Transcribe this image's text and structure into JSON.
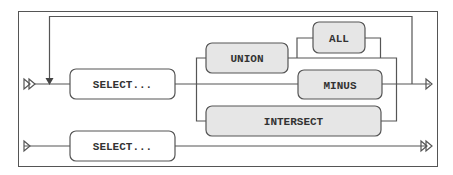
{
  "diagram": {
    "type": "railroad",
    "colors": {
      "line": "#555555",
      "nonterminal_fill": "#ffffff",
      "terminal_fill": "#e6e6e6",
      "frame": "#555555",
      "text": "#333333"
    },
    "nodes": {
      "select_top": {
        "label": "SELECT...",
        "kind": "nonterminal"
      },
      "union": {
        "label": "UNION",
        "kind": "terminal"
      },
      "all": {
        "label": "ALL",
        "kind": "terminal"
      },
      "minus": {
        "label": "MINUS",
        "kind": "terminal"
      },
      "intersect": {
        "label": "INTERSECT",
        "kind": "terminal"
      },
      "select_bottom": {
        "label": "SELECT...",
        "kind": "nonterminal"
      }
    },
    "edges": [
      {
        "from": "start-top",
        "to": "select_top"
      },
      {
        "from": "select_top",
        "to": "union"
      },
      {
        "from": "select_top",
        "to": "minus"
      },
      {
        "from": "select_top",
        "to": "intersect"
      },
      {
        "from": "union",
        "to": "all",
        "optional": true
      },
      {
        "from": "union",
        "to": "end-top"
      },
      {
        "from": "minus",
        "to": "end-top"
      },
      {
        "from": "intersect",
        "to": "end-top"
      },
      {
        "from": "end-top",
        "to": "start-top",
        "loop": true
      },
      {
        "from": "start-bottom",
        "to": "select_bottom"
      },
      {
        "from": "select_bottom",
        "to": "end-bottom"
      }
    ]
  }
}
